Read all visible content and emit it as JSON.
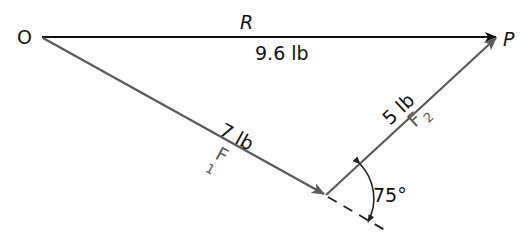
{
  "diagram": {
    "type": "vector-triangle",
    "points": {
      "origin": {
        "label": "O",
        "x": 27,
        "y": 37
      },
      "end": {
        "label": "P",
        "x": 497,
        "y": 37
      },
      "joint": {
        "x": 326,
        "y": 195
      }
    },
    "vectors": [
      {
        "id": "R",
        "name": "R",
        "magnitude": "9.6 lb",
        "from": "O",
        "to": "P",
        "color": "#111111"
      },
      {
        "id": "F1",
        "name": "F",
        "subscript": "1",
        "magnitude": "7 lb",
        "from": "O",
        "to": "joint",
        "color": "#5a5a5a"
      },
      {
        "id": "F2",
        "name": "F",
        "subscript": "2",
        "magnitude": "5 lb",
        "from": "joint",
        "to": "P",
        "color": "#5a5a5a"
      }
    ],
    "angle": {
      "label": "75°",
      "between": [
        "F1 extension",
        "F2"
      ]
    }
  },
  "labels": {
    "O": "O",
    "P": "P",
    "R": "R",
    "R_mag": "9.6 lb",
    "F1_mag": "7 lb",
    "F1_name": "F",
    "F1_sub": "1",
    "F2_mag": "5 lb",
    "F2_name": "F",
    "F2_sub": "2",
    "angle": "75°"
  }
}
